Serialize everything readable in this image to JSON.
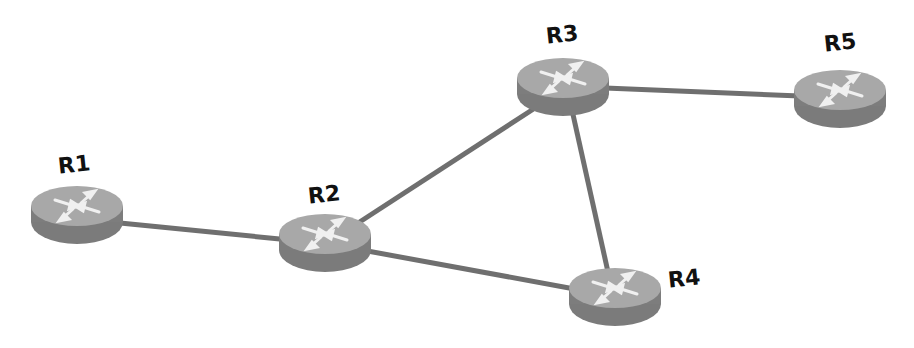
{
  "diagram": {
    "type": "network-topology",
    "colors": {
      "link": "#6f6f6f",
      "router_top": "#a9a9a9",
      "router_side": "#7d7d7d",
      "router_arrows": "#f2f2f2",
      "label": "#111111"
    },
    "nodes": [
      {
        "id": "R1",
        "label": "R1",
        "cx": 77,
        "cy": 210,
        "label_x": 55,
        "label_y": 150
      },
      {
        "id": "R2",
        "label": "R2",
        "cx": 325,
        "cy": 238,
        "label_x": 306,
        "label_y": 180
      },
      {
        "id": "R3",
        "label": "R3",
        "cx": 563,
        "cy": 80,
        "label_x": 545,
        "label_y": 20
      },
      {
        "id": "R4",
        "label": "R4",
        "cx": 615,
        "cy": 292,
        "label_x": 668,
        "label_y": 262
      },
      {
        "id": "R5",
        "label": "R5",
        "cx": 840,
        "cy": 90,
        "label_x": 824,
        "label_y": 28
      }
    ],
    "links": [
      {
        "from": "R1",
        "to": "R2"
      },
      {
        "from": "R2",
        "to": "R3"
      },
      {
        "from": "R2",
        "to": "R4"
      },
      {
        "from": "R3",
        "to": "R4"
      },
      {
        "from": "R3",
        "to": "R5"
      }
    ]
  }
}
